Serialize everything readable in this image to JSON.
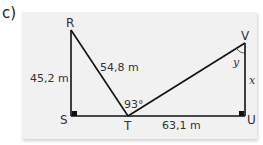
{
  "part_label": "c)",
  "figure": {
    "vertices": {
      "R": {
        "label": "R"
      },
      "S": {
        "label": "S"
      },
      "T": {
        "label": "T"
      },
      "U": {
        "label": "U"
      },
      "V": {
        "label": "V"
      }
    },
    "measurements": {
      "RS": "45,2 m",
      "RT": "54,8 m",
      "TU": "63,1 m",
      "angle_RTV": "93°"
    },
    "unknowns": {
      "VU": "x",
      "angle_TVU": "y"
    },
    "right_angles": [
      "S",
      "U"
    ],
    "colors": {
      "panel_background": "#f1f1f1",
      "line": "#111111",
      "text": "#333333"
    }
  }
}
